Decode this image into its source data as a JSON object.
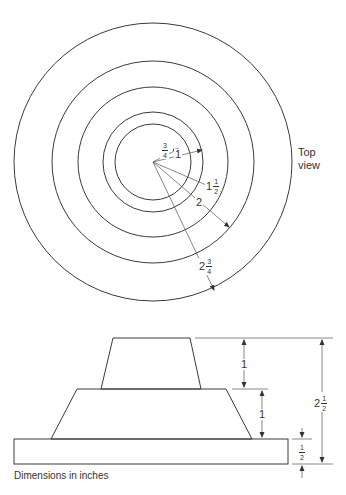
{
  "top_view": {
    "label_line1": "Top",
    "label_line2": "view",
    "radii_labels": [
      {
        "whole": "",
        "num": "3",
        "den": "4"
      },
      {
        "whole": "1",
        "num": "",
        "den": ""
      },
      {
        "whole": "1",
        "num": "1",
        "den": "2"
      },
      {
        "whole": "2",
        "num": "",
        "den": ""
      },
      {
        "whole": "2",
        "num": "3",
        "den": "4"
      }
    ]
  },
  "side_view": {
    "dims": [
      {
        "whole": "1",
        "num": "",
        "den": ""
      },
      {
        "whole": "1",
        "num": "",
        "den": ""
      },
      {
        "whole": "",
        "num": "1",
        "den": "2"
      },
      {
        "whole": "2",
        "num": "1",
        "den": "2"
      }
    ],
    "caption": "Dimensions in inches"
  }
}
